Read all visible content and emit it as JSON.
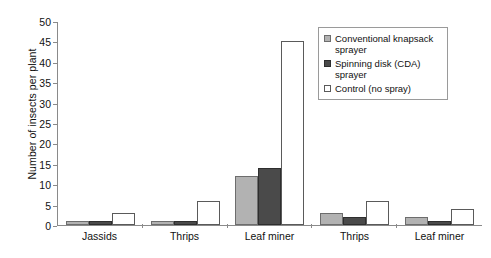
{
  "chart_data": {
    "type": "bar",
    "title": "",
    "xlabel": "",
    "ylabel": "Number of insects per plant",
    "ylim": [
      0,
      50
    ],
    "ytick_step": 5,
    "yticks": [
      50,
      45,
      40,
      35,
      30,
      25,
      20,
      15,
      10,
      5,
      0
    ],
    "grid": false,
    "legend_position": "top-right",
    "categories": [
      "Jassids",
      "Thrips",
      "Leaf miner",
      "Thrips",
      "Leaf miner"
    ],
    "series": [
      {
        "name": "Conventional knapsack sprayer",
        "color": "#b2b2b2",
        "values": [
          1,
          1,
          12,
          3,
          2
        ]
      },
      {
        "name": "Spinning disk (CDA) sprayer",
        "color": "#4a4a4a",
        "values": [
          1,
          1,
          14,
          2,
          1
        ]
      },
      {
        "name": "Control (no spray)",
        "color": "#ffffff",
        "values": [
          3,
          6,
          45,
          6,
          4
        ]
      }
    ]
  },
  "legend": {
    "items": [
      {
        "label": "Conventional knapsack sprayer",
        "swatch": "legend-swatch-conventional"
      },
      {
        "label": "Spinning disk (CDA) sprayer",
        "swatch": "legend-swatch-spinning-disk"
      },
      {
        "label": "Control (no spray)",
        "swatch": "legend-swatch-control"
      }
    ]
  }
}
